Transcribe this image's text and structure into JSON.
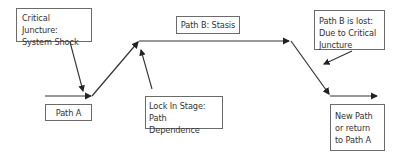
{
  "diagram": {
    "labels": {
      "critical_juncture": "Critical Juncture: System Shock",
      "path_b_stasis": "Path B: Stasis",
      "path_b_lost": "Path B is lost: Due to Critical Juncture",
      "path_a": "Path A",
      "lock_in": "Lock In Stage: Path Dependence",
      "new_path": "New Path or return to Path A"
    },
    "nodes": [
      "Path A",
      "Critical Juncture: System Shock",
      "Lock In Stage: Path Dependence",
      "Path B: Stasis",
      "Path B is lost: Due to Critical Juncture",
      "New Path or return to Path A"
    ],
    "edges": [
      {
        "from": "Path A",
        "to": "Path B: Stasis",
        "type": "path"
      },
      {
        "from": "Path B: Stasis",
        "to": "New Path or return to Path A",
        "type": "path"
      },
      {
        "from": "Critical Juncture: System Shock",
        "to": "Path A",
        "type": "annotation"
      },
      {
        "from": "Lock In Stage: Path Dependence",
        "to": "Path B: Stasis",
        "type": "annotation"
      },
      {
        "from": "Path B is lost: Due to Critical Juncture",
        "to": "New Path or return to Path A",
        "type": "annotation"
      }
    ]
  }
}
